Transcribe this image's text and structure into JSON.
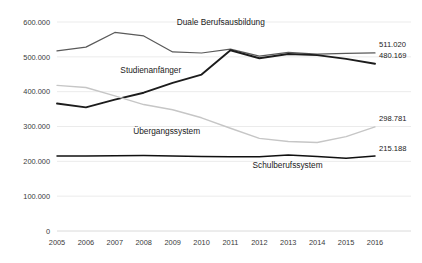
{
  "chart_data": {
    "type": "line",
    "title": "",
    "xlabel": "",
    "ylabel": "",
    "ylim": [
      0,
      600000
    ],
    "grid": true,
    "legend_position": "inline-annotations",
    "categories": [
      "2005",
      "2006",
      "2007",
      "2008",
      "2009",
      "2010",
      "2011",
      "2012",
      "2013",
      "2014",
      "2015",
      "2016"
    ],
    "y_ticks": [
      "0",
      "100.000",
      "200.000",
      "300.000",
      "400.000",
      "500.000",
      "600.000"
    ],
    "y_tick_values": [
      0,
      100000,
      200000,
      300000,
      400000,
      500000,
      600000
    ],
    "series": [
      {
        "name": "Duale Berufsausbildung",
        "color": "#5a5a5a",
        "width": 1.25,
        "values": [
          517000,
          528000,
          570000,
          560000,
          514000,
          511000,
          522000,
          502000,
          513000,
          508000,
          510000,
          511020
        ],
        "end_label": "511.020",
        "label_x_frac": 0.515,
        "label_y_value": 592000
      },
      {
        "name": "Studienanfänger",
        "color": "#1c1c1c",
        "width": 1.9,
        "values": [
          366000,
          355000,
          377000,
          397000,
          425000,
          449000,
          519000,
          496000,
          508000,
          505000,
          494000,
          480169
        ],
        "end_label": "480.169",
        "label_x_frac": 0.295,
        "label_y_value": 455000
      },
      {
        "name": "Übergangssystem",
        "color": "#c6c6c6",
        "width": 1.4,
        "values": [
          418000,
          412000,
          388000,
          363000,
          348000,
          325000,
          295000,
          266000,
          257000,
          254000,
          271000,
          298781
        ],
        "end_label": "298.781",
        "label_x_frac": 0.345,
        "label_y_value": 278000
      },
      {
        "name": "Schulberufssystem",
        "color": "#101010",
        "width": 1.5,
        "values": [
          215000,
          215500,
          216000,
          216500,
          215500,
          214000,
          213500,
          213000,
          218000,
          214000,
          209000,
          215188
        ],
        "end_label": "215.188",
        "label_x_frac": 0.725,
        "label_y_value": 182000
      }
    ]
  }
}
